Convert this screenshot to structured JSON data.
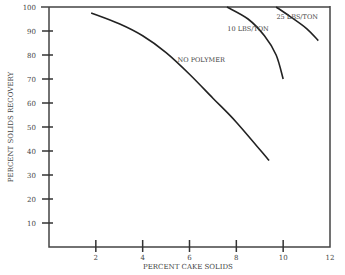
{
  "chart_data": {
    "type": "line",
    "title": "",
    "xlabel": "PERCENT CAKE SOLIDS",
    "ylabel": "PERCENT SOLIDS RECOVERY",
    "xlim": [
      0,
      12
    ],
    "ylim": [
      0,
      100
    ],
    "x_ticks": [
      2,
      4,
      6,
      8,
      10,
      12
    ],
    "y_ticks": [
      10,
      20,
      30,
      40,
      50,
      60,
      70,
      80,
      90,
      100
    ],
    "grid": false,
    "series": [
      {
        "name": "NO POLYMER",
        "points": [
          [
            1.8,
            97.5
          ],
          [
            3,
            93
          ],
          [
            4,
            88
          ],
          [
            5,
            81
          ],
          [
            6,
            72
          ],
          [
            7,
            62
          ],
          [
            8,
            52
          ],
          [
            9.4,
            36
          ]
        ]
      },
      {
        "name": "10 LBS/TON",
        "points": [
          [
            7.6,
            100
          ],
          [
            8.5,
            95
          ],
          [
            9.2,
            88
          ],
          [
            9.7,
            80
          ],
          [
            10,
            70
          ]
        ]
      },
      {
        "name": "25 LBS/TON",
        "points": [
          [
            9.7,
            100
          ],
          [
            10.3,
            96
          ],
          [
            11,
            91
          ],
          [
            11.5,
            86
          ]
        ]
      }
    ],
    "annotations": [
      {
        "text": "NO POLYMER",
        "x": 6.5,
        "y": 77
      },
      {
        "text": "10 LBS/TON",
        "x": 8.5,
        "y": 90
      },
      {
        "text": "25 LBS/TON",
        "x": 10.6,
        "y": 95
      }
    ]
  }
}
